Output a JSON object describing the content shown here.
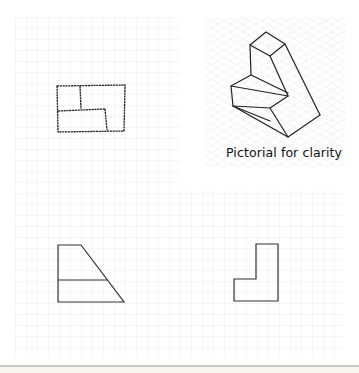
{
  "figure": {
    "caption": "Pictorial for clarity",
    "colors": {
      "background": "#ffffff",
      "grid": "#e6e6e6",
      "iso_grid": "#ececec",
      "sketch_line": "#222222",
      "drawing_line": "#333333",
      "bottom_rule": "#c9c9c4"
    },
    "grid_spacing_px": 11,
    "views": [
      {
        "name": "plan-view",
        "style": "sketch",
        "description": "Top view, rectangle with internal step lines"
      },
      {
        "name": "pictorial-view",
        "style": "sketch",
        "description": "Isometric pictorial of stepped block"
      },
      {
        "name": "front-view",
        "style": "drawn",
        "description": "Trapezoid with horizontal dividing line"
      },
      {
        "name": "side-view",
        "style": "drawn",
        "description": "L-shaped outline"
      }
    ]
  }
}
